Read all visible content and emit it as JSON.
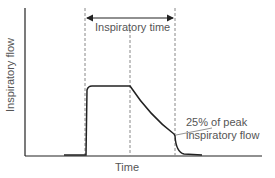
{
  "diagram": {
    "axes": {
      "y_label": "Inspiratory flow",
      "x_label": "Time"
    },
    "interval_label": "Inspiratory time",
    "annotation": {
      "line1": "25% of peak",
      "line2": "inspiratory flow"
    },
    "colors": {
      "axis": "#222222",
      "curve": "#222222",
      "dashed": "#888888",
      "text": "#555555"
    }
  }
}
